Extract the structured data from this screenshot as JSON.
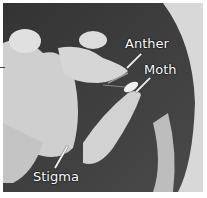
{
  "image": {
    "description": "Grayscale photograph of a flower with a moth, with labeled parts",
    "labels": [
      {
        "id": "anther",
        "text": "Anther"
      },
      {
        "id": "moth",
        "text": "Moth"
      },
      {
        "id": "stigma",
        "text": "Stigma"
      }
    ]
  }
}
